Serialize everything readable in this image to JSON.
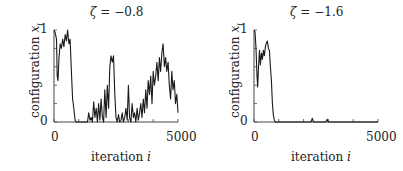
{
  "chart_data": [
    {
      "type": "line",
      "title": "ζ = −0.8",
      "xlabel": "iteration i",
      "ylabel": "configuration x_i",
      "xlim": [
        0,
        5000
      ],
      "ylim": [
        0,
        1
      ],
      "x_ticks": [
        "0",
        "5000"
      ],
      "y_ticks": [
        "0",
        "1"
      ],
      "grid": false,
      "series": [
        {
          "name": "x_i",
          "x": [
            0,
            50,
            100,
            130,
            160,
            200,
            250,
            300,
            350,
            400,
            450,
            500,
            550,
            600,
            650,
            700,
            750,
            800,
            850,
            900,
            1000,
            1100,
            1200,
            1300,
            1350,
            1400,
            1450,
            1500,
            1550,
            1600,
            1650,
            1700,
            1750,
            1800,
            1850,
            1900,
            1950,
            2000,
            2050,
            2100,
            2150,
            2200,
            2250,
            2300,
            2350,
            2400,
            2450,
            2500,
            2550,
            2600,
            2650,
            2700,
            2750,
            2800,
            2850,
            2900,
            2950,
            3000,
            3050,
            3100,
            3150,
            3200,
            3250,
            3300,
            3350,
            3400,
            3450,
            3500,
            3550,
            3600,
            3650,
            3700,
            3750,
            3800,
            3850,
            3900,
            3950,
            4000,
            4050,
            4100,
            4150,
            4200,
            4250,
            4300,
            4350,
            4400,
            4450,
            4500,
            4550,
            4600,
            4650,
            4700,
            4750,
            4800,
            4850,
            4900,
            4950,
            5000
          ],
          "values": [
            1.0,
            0.97,
            0.9,
            0.5,
            0.45,
            0.7,
            0.85,
            0.8,
            0.9,
            0.82,
            0.95,
            0.88,
            1.0,
            0.85,
            0.9,
            0.55,
            0.25,
            0.15,
            0.02,
            0.0,
            0.0,
            0.0,
            0.0,
            0.0,
            0.0,
            0.1,
            0.02,
            0.05,
            0.0,
            0.22,
            0.05,
            0.15,
            0.0,
            0.2,
            0.02,
            0.25,
            0.05,
            0.0,
            0.35,
            0.05,
            0.4,
            0.15,
            0.6,
            0.72,
            0.65,
            0.72,
            0.3,
            0.05,
            0.0,
            0.08,
            0.0,
            0.02,
            0.1,
            0.0,
            0.05,
            0.15,
            0.02,
            0.4,
            0.05,
            0.0,
            0.2,
            0.05,
            0.1,
            0.0,
            0.15,
            0.02,
            0.1,
            0.2,
            0.05,
            0.25,
            0.1,
            0.35,
            0.15,
            0.45,
            0.3,
            0.5,
            0.2,
            0.55,
            0.4,
            0.5,
            0.65,
            0.45,
            0.7,
            0.55,
            0.75,
            0.85,
            0.6,
            0.7,
            0.55,
            0.65,
            0.4,
            0.25,
            0.55,
            0.35,
            0.45,
            0.2,
            0.3,
            0.1
          ]
        }
      ]
    },
    {
      "type": "line",
      "title": "ζ = −1.6",
      "xlabel": "iteration i",
      "ylabel": "configuration x_i",
      "xlim": [
        0,
        5000
      ],
      "ylim": [
        0,
        1
      ],
      "x_ticks": [
        "0",
        "5000"
      ],
      "y_ticks": [
        "0",
        "1"
      ],
      "grid": false,
      "series": [
        {
          "name": "x_i",
          "x": [
            0,
            40,
            80,
            120,
            150,
            180,
            220,
            260,
            300,
            340,
            380,
            420,
            460,
            500,
            540,
            580,
            620,
            660,
            700,
            740,
            780,
            820,
            860,
            900,
            1000,
            1500,
            2000,
            2300,
            2350,
            2400,
            2450,
            2500,
            2900,
            2950,
            3000,
            3500,
            4000,
            4500,
            5000
          ],
          "values": [
            1.0,
            0.98,
            0.8,
            0.5,
            0.38,
            0.6,
            0.78,
            0.62,
            0.75,
            0.68,
            0.78,
            0.72,
            0.82,
            0.86,
            0.88,
            0.8,
            0.78,
            0.6,
            0.45,
            0.2,
            0.08,
            0.02,
            0.0,
            0.0,
            0.0,
            0.0,
            0.0,
            0.0,
            0.04,
            0.0,
            0.0,
            0.0,
            0.0,
            0.03,
            0.0,
            0.0,
            0.0,
            0.0,
            0.0
          ]
        }
      ]
    }
  ],
  "panels": [
    {
      "title_sym": "ζ",
      "title_val": "= −0.8",
      "ylabel_text": "configuration ",
      "ylabel_var": "x",
      "ylabel_sub": "i",
      "ytick_top": "1",
      "ytick_bottom": "0",
      "xtick_left": "0",
      "xtick_right": "5000",
      "xlabel_text": "iteration ",
      "xlabel_var": "i"
    },
    {
      "title_sym": "ζ",
      "title_val": "= −1.6",
      "ylabel_text": "configuration ",
      "ylabel_var": "x",
      "ylabel_sub": "i",
      "ytick_top": "1",
      "ytick_bottom": "0",
      "xtick_left": "0",
      "xtick_right": "5000",
      "xlabel_text": "iteration ",
      "xlabel_var": "i"
    }
  ],
  "style": {
    "line_color": "#1a1a1a",
    "axis_color": "#444444"
  }
}
